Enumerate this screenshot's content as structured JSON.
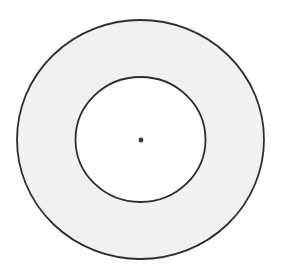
{
  "diagram": {
    "type": "concentric-circles",
    "colors": {
      "background": "#ffffff",
      "ring_fill": "#f1f1f1",
      "inner_fill": "#ffffff",
      "stroke": "#2e2e2e",
      "center_dot": "#333333"
    },
    "outer_circle": {
      "cx": 140.5,
      "cy": 139.5,
      "rx": 123.5,
      "ry": 119.5
    },
    "inner_circle": {
      "cx": 140.5,
      "cy": 139.5,
      "rx": 65,
      "ry": 62.5
    },
    "center_point": {
      "cx": 141,
      "cy": 140,
      "r": 2.4
    }
  }
}
